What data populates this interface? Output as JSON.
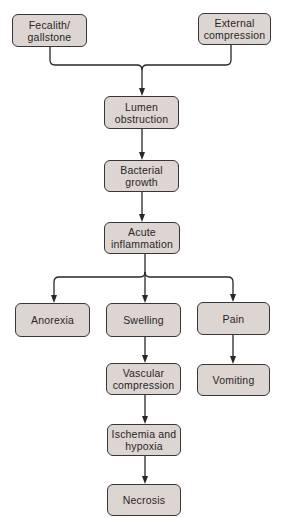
{
  "diagram": {
    "type": "flowchart",
    "colors": {
      "node_fill": "#dcd5d1",
      "node_border": "#3a3636",
      "line": "#2a2626",
      "text": "#2a2626"
    },
    "nodes": {
      "fecalith": "Fecalith/\ngallstone",
      "external": "External\ncompression",
      "lumen": "Lumen\nobstruction",
      "bacterial": "Bacterial\ngrowth",
      "acute": "Acute\ninflammation",
      "anorexia": "Anorexia",
      "swelling": "Swelling",
      "pain": "Pain",
      "vascular": "Vascular\ncompression",
      "vomiting": "Vomiting",
      "ischemia": "Ischemia and\nhypoxia",
      "necrosis": "Necrosis"
    },
    "edges": [
      [
        "Fecalith/gallstone",
        "Lumen obstruction"
      ],
      [
        "External compression",
        "Lumen obstruction"
      ],
      [
        "Lumen obstruction",
        "Bacterial growth"
      ],
      [
        "Bacterial growth",
        "Acute inflammation"
      ],
      [
        "Acute inflammation",
        "Anorexia"
      ],
      [
        "Acute inflammation",
        "Swelling"
      ],
      [
        "Acute inflammation",
        "Pain"
      ],
      [
        "Swelling",
        "Vascular compression"
      ],
      [
        "Pain",
        "Vomiting"
      ],
      [
        "Vascular compression",
        "Ischemia and hypoxia"
      ],
      [
        "Ischemia and hypoxia",
        "Necrosis"
      ]
    ]
  }
}
